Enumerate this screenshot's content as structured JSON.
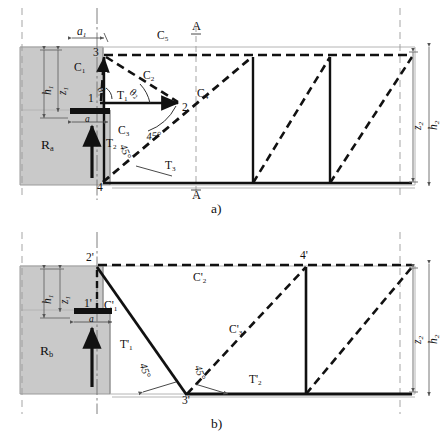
{
  "figure": {
    "type": "strut-and-tie-model",
    "caption_a": "a)",
    "caption_b": "b)"
  },
  "colors": {
    "line": "#111111",
    "concrete_fill": "#c9c9c9",
    "concrete_stroke": "#9a9a9a",
    "thin_gray": "#b4b4b4",
    "dash_axis": "#8c8c8c"
  },
  "panel_a": {
    "name": "a)",
    "nodes": [
      {
        "id": "n1",
        "label": "1",
        "x": 100,
        "y": 97
      },
      {
        "id": "n2",
        "label": "2",
        "x": 180,
        "y": 103
      },
      {
        "id": "n3",
        "label": "3",
        "x": 104,
        "y": 55
      },
      {
        "id": "n4",
        "label": "4",
        "x": 102,
        "y": 182
      }
    ],
    "struts": [
      {
        "id": "C1",
        "label": "C",
        "sub": "1"
      },
      {
        "id": "C2",
        "label": "C",
        "sub": "2"
      },
      {
        "id": "C3",
        "label": "C",
        "sub": "3"
      },
      {
        "id": "C4",
        "label": "C",
        "sub": "4"
      },
      {
        "id": "C5",
        "label": "C",
        "sub": "5"
      }
    ],
    "ties": [
      {
        "id": "T1",
        "label": "T",
        "sub": "1"
      },
      {
        "id": "T2",
        "label": "T",
        "sub": "2"
      },
      {
        "id": "T3",
        "label": "T",
        "sub": "3"
      }
    ],
    "angles": [
      {
        "id": "theta1",
        "label": "θ",
        "sub": "1"
      },
      {
        "id": "theta2",
        "label": "θ",
        "sub": "2"
      },
      {
        "id": "ang45a",
        "label": "45°"
      },
      {
        "id": "ang45b",
        "label": "45°"
      }
    ],
    "dimensions": [
      {
        "id": "a1",
        "label": "a",
        "sub": "1"
      },
      {
        "id": "a",
        "label": "a"
      },
      {
        "id": "h1",
        "label": "h",
        "sub": "1"
      },
      {
        "id": "z1",
        "label": "z",
        "sub": "1"
      },
      {
        "id": "h2",
        "label": "h",
        "sub": "2"
      },
      {
        "id": "z2",
        "label": "z",
        "sub": "2"
      }
    ],
    "reaction": {
      "id": "Ra",
      "label": "R",
      "sub": "a"
    },
    "section_marks": [
      {
        "id": "section-A-top",
        "label": "A"
      },
      {
        "id": "section-A-bottom",
        "label": "A"
      }
    ]
  },
  "panel_b": {
    "name": "b)",
    "nodes": [
      {
        "id": "n1p",
        "label": "1'",
        "x": 97,
        "y": 307
      },
      {
        "id": "n2p",
        "label": "2'",
        "x": 97,
        "y": 262
      },
      {
        "id": "n3p",
        "label": "3'",
        "x": 186,
        "y": 394
      },
      {
        "id": "n4p",
        "label": "4'",
        "x": 306,
        "y": 265
      }
    ],
    "struts": [
      {
        "id": "C1p",
        "label": "C",
        "sub": "1",
        "prime": true
      },
      {
        "id": "C2p",
        "label": "C",
        "sub": "2",
        "prime": true
      },
      {
        "id": "C3p",
        "label": "C",
        "sub": "3",
        "prime": true
      }
    ],
    "ties": [
      {
        "id": "T1p",
        "label": "T",
        "sub": "1",
        "prime": true
      },
      {
        "id": "T2p",
        "label": "T",
        "sub": "2",
        "prime": true
      }
    ],
    "angles": [
      {
        "id": "ang45c",
        "label": "45°"
      },
      {
        "id": "ang45d",
        "label": "45°"
      }
    ],
    "dimensions": [
      {
        "id": "a",
        "label": "a"
      },
      {
        "id": "h1",
        "label": "h",
        "sub": "1"
      },
      {
        "id": "z1",
        "label": "z",
        "sub": "1"
      },
      {
        "id": "h2",
        "label": "h",
        "sub": "2"
      },
      {
        "id": "z2",
        "label": "z",
        "sub": "2"
      }
    ],
    "reaction": {
      "id": "Rb",
      "label": "R",
      "sub": "b"
    }
  }
}
